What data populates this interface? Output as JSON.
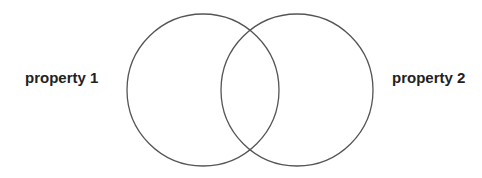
{
  "diagram": {
    "type": "venn",
    "sets": [
      {
        "label": "property 1",
        "cx": 203,
        "cy": 90,
        "r": 76
      },
      {
        "label": "property 2",
        "cx": 297,
        "cy": 90,
        "r": 76
      }
    ],
    "stroke_color": "#555555",
    "background": "#ffffff"
  }
}
